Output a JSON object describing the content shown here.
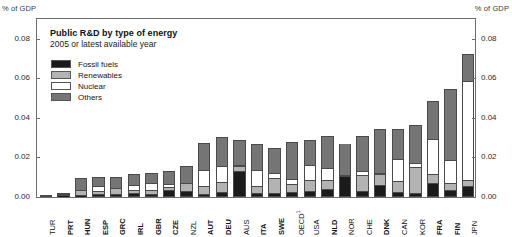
{
  "axis_unit_left": "% of GDP",
  "axis_unit_right": "% of GDP",
  "title": "Public R&D by type of energy",
  "subtitle": "2005 or latest available year",
  "legend": [
    {
      "label": "Fossil fuels",
      "color": "#1b1b1b"
    },
    {
      "label": "Renewables",
      "color": "#b3b3b3"
    },
    {
      "label": "Nuclear",
      "color": "#ffffff"
    },
    {
      "label": "Others",
      "color": "#757575"
    }
  ],
  "chart_data": {
    "type": "bar",
    "subtype": "stacked-column",
    "title": "Public R&D by type of energy",
    "subtitle": "2005 or latest available year",
    "xlabel": "",
    "ylabel": "% of GDP",
    "ylim": [
      0,
      0.09
    ],
    "yticks": [
      0.0,
      0.02,
      0.04,
      0.06,
      0.08
    ],
    "ytick_labels": [
      "0.00",
      "0.02",
      "0.04",
      "0.06",
      "0.08"
    ],
    "grid": false,
    "legend_position": "top-left-inside",
    "series": [
      {
        "name": "Fossil fuels",
        "color": "#1b1b1b",
        "values": [
          0.0,
          0.0002,
          0.0002,
          0.0004,
          0.0006,
          0.0012,
          0.0006,
          0.0028,
          0.0022,
          0.0004,
          0.0018,
          0.0128,
          0.0008,
          0.001,
          0.0016,
          0.0022,
          0.003,
          0.0098,
          0.002,
          0.0052,
          0.0018,
          0.0012,
          0.0062,
          0.0028,
          0.0046
        ]
      },
      {
        "name": "Renewables",
        "color": "#b3b3b3",
        "values": [
          0.0004,
          0.0008,
          0.0024,
          0.002,
          0.0034,
          0.0016,
          0.002,
          0.0016,
          0.0042,
          0.0044,
          0.0048,
          0.0022,
          0.004,
          0.0082,
          0.004,
          0.0056,
          0.005,
          0.0004,
          0.0086,
          0.0056,
          0.0056,
          0.0132,
          0.0046,
          0.0036,
          0.003
        ]
      },
      {
        "name": "Nuclear",
        "color": "#ffffff",
        "values": [
          0.0,
          0.0,
          0.0,
          0.0028,
          0.0,
          0.0026,
          0.004,
          0.0014,
          0.0,
          0.0082,
          0.0086,
          0.0006,
          0.0082,
          0.0026,
          0.0026,
          0.0078,
          0.006,
          0.0,
          0.0018,
          0.0008,
          0.0112,
          0.002,
          0.018,
          0.0118,
          0.051
        ]
      },
      {
        "name": "Others",
        "color": "#757575",
        "values": [
          0.0004,
          0.0008,
          0.0068,
          0.005,
          0.0062,
          0.0062,
          0.0054,
          0.0074,
          0.0092,
          0.0142,
          0.015,
          0.013,
          0.014,
          0.0128,
          0.0198,
          0.0132,
          0.017,
          0.0168,
          0.0186,
          0.0226,
          0.0156,
          0.0198,
          0.02,
          0.0366,
          0.0136
        ]
      }
    ],
    "categories": [
      "TUR",
      "PRT",
      "HUN",
      "ESP",
      "GRC",
      "IRL",
      "GBR",
      "CZE",
      "NZL",
      "AUT",
      "DEU",
      "AUS",
      "ITA",
      "SWE",
      "OECD¹",
      "USA",
      "NLD",
      "NOR",
      "CHE",
      "DNK",
      "CAN",
      "KOR",
      "FRA",
      "FIN",
      "JPN"
    ],
    "category_bold": [
      false,
      true,
      true,
      true,
      true,
      true,
      true,
      true,
      false,
      true,
      true,
      false,
      true,
      true,
      false,
      false,
      true,
      false,
      false,
      true,
      false,
      false,
      true,
      true,
      false
    ],
    "totals": [
      0.0008,
      0.0018,
      0.0094,
      0.0102,
      0.0102,
      0.0116,
      0.012,
      0.0132,
      0.0156,
      0.0272,
      0.0302,
      0.0286,
      0.027,
      0.0246,
      0.028,
      0.0288,
      0.031,
      0.027,
      0.031,
      0.0342,
      0.0342,
      0.0362,
      0.0488,
      0.0548,
      0.0722
    ]
  }
}
